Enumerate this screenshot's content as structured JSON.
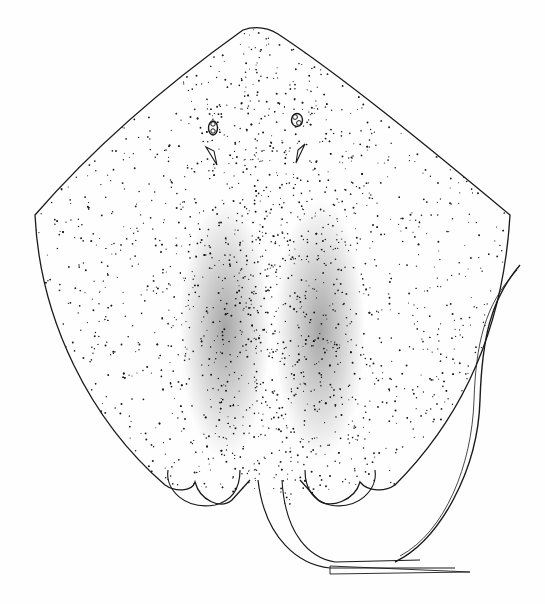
{
  "illustration": {
    "subject": "stingray, dorsal view",
    "style": "stippled pen-and-ink drawing",
    "colors": {
      "background": "#fefefe",
      "ink": "#1a1a1a"
    }
  }
}
